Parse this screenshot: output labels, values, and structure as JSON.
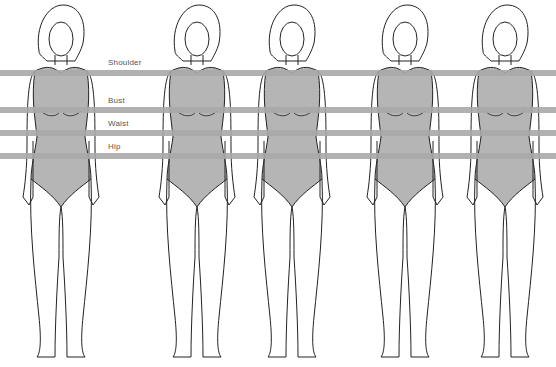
{
  "diagram": {
    "measurement_lines": [
      {
        "label": "Shoulder",
        "y": 70,
        "label_y": 58
      },
      {
        "label": "Bust",
        "y": 107,
        "label_y": 96
      },
      {
        "label": "Waist",
        "y": 130,
        "label_y": 119
      },
      {
        "label": "Hip",
        "y": 153,
        "label_y": 142
      }
    ],
    "figures": [
      {
        "id": "figure-1",
        "center_x": 61
      },
      {
        "id": "figure-2",
        "center_x": 197
      },
      {
        "id": "figure-3",
        "center_x": 292
      },
      {
        "id": "figure-4",
        "center_x": 405
      },
      {
        "id": "figure-5",
        "center_x": 505
      }
    ],
    "colors": {
      "band": "#a9a9a9",
      "bodysuit": "#b5b5b5",
      "outline": "#222222",
      "label": "#555555"
    }
  }
}
